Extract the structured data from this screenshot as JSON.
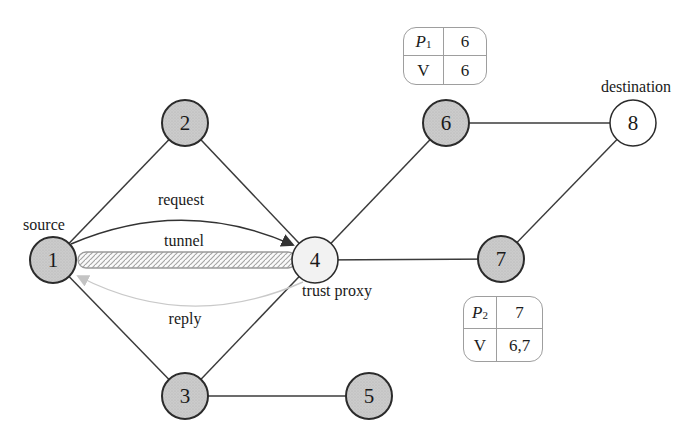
{
  "nodes": {
    "n1": {
      "label": "1",
      "annotation": "source"
    },
    "n2": {
      "label": "2"
    },
    "n3": {
      "label": "3"
    },
    "n4": {
      "label": "4",
      "annotation": "trust proxy"
    },
    "n5": {
      "label": "5"
    },
    "n6": {
      "label": "6"
    },
    "n7": {
      "label": "7"
    },
    "n8": {
      "label": "8",
      "annotation": "destination"
    }
  },
  "edge_labels": {
    "request": "request",
    "tunnel": "tunnel",
    "reply": "reply"
  },
  "graph": {
    "edges": [
      "1-2",
      "2-4",
      "1-3",
      "3-4",
      "3-5",
      "4-6",
      "4-7",
      "6-8",
      "7-8"
    ],
    "tunnel_between": "1-4",
    "request_arrow": "1-4",
    "reply_arrow": "4-1"
  },
  "tables": {
    "p1": {
      "row1_label": "P",
      "row1_sub": "1",
      "row1_value": "6",
      "row2_label": "V",
      "row2_value": "6"
    },
    "p2": {
      "row1_label": "P",
      "row1_sub": "2",
      "row1_value": "7",
      "row2_label": "V",
      "row2_value": "6,7"
    }
  },
  "colors": {
    "shaded_node_fill": "#cbcbcb",
    "proxy_node_fill": "#f2f2f2",
    "destination_node_fill": "#ffffff",
    "node_border": "#2b2b2b",
    "edge": "#3b3b3b",
    "request_arc": "#333333",
    "reply_arc": "#c9c9c9",
    "tunnel_hatch": "#a3a3a3",
    "table_border": "#9e9e9e"
  }
}
